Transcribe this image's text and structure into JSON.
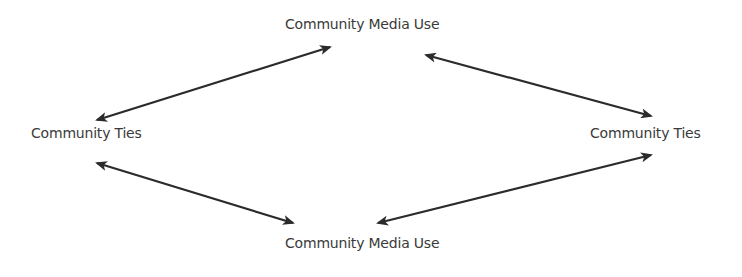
{
  "diagram": {
    "nodes": {
      "top": "Community Media Use",
      "left": "Community Ties",
      "right": "Community Ties",
      "bottom": "Community Media Use"
    },
    "edges": [
      {
        "from": "left",
        "to": "top",
        "type": "bidirectional"
      },
      {
        "from": "top",
        "to": "right",
        "type": "bidirectional"
      },
      {
        "from": "left",
        "to": "bottom",
        "type": "bidirectional"
      },
      {
        "from": "bottom",
        "to": "right",
        "type": "bidirectional"
      }
    ],
    "colors": {
      "arrow": "#2b2b2b",
      "text": "#3a3a3a",
      "background": "#ffffff"
    }
  }
}
